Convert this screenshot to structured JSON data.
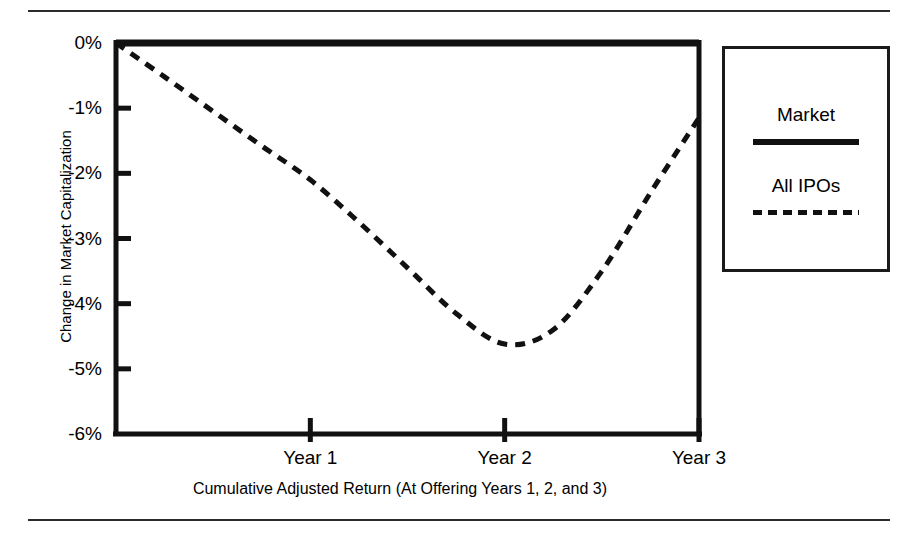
{
  "chart_data": {
    "type": "line",
    "title": "",
    "xlabel": "Cumulative Adjusted Return (At Offering Years 1, 2, and 3)",
    "ylabel": "Change in Market Capitalization",
    "xlim": [
      0,
      3
    ],
    "ylim": [
      -6,
      0
    ],
    "grid": false,
    "legend_position": "right",
    "x_tick_labels": [
      "Year 1",
      "Year 2",
      "Year 3"
    ],
    "x_tick_values": [
      1,
      2,
      3
    ],
    "y_tick_labels": [
      "0%",
      "-1%",
      "-2%",
      "-3%",
      "-4%",
      "-5%",
      "-6%"
    ],
    "y_tick_values": [
      0,
      -1,
      -2,
      -3,
      -4,
      -5,
      -6
    ],
    "series": [
      {
        "name": "Market",
        "style": "solid",
        "color": "#111111",
        "x": [
          0,
          1,
          2,
          3
        ],
        "values": [
          0,
          0,
          0,
          0
        ]
      },
      {
        "name": "All IPOs",
        "style": "dashed",
        "color": "#111111",
        "x": [
          0,
          0.25,
          0.5,
          0.75,
          1,
          1.25,
          1.5,
          1.75,
          2,
          2.25,
          2.5,
          2.75,
          3
        ],
        "values": [
          0,
          -0.52,
          -1.05,
          -1.58,
          -2.1,
          -2.75,
          -3.45,
          -4.15,
          -4.62,
          -4.4,
          -3.5,
          -2.3,
          -1.15
        ]
      }
    ]
  },
  "legend": {
    "entries": [
      {
        "label": "Market",
        "style": "solid"
      },
      {
        "label": "All IPOs",
        "style": "dashed"
      }
    ]
  },
  "axes": {
    "y_title": "Change in Market Capitalization",
    "x_caption": "Cumulative Adjusted Return (At Offering Years 1, 2, and 3)"
  }
}
